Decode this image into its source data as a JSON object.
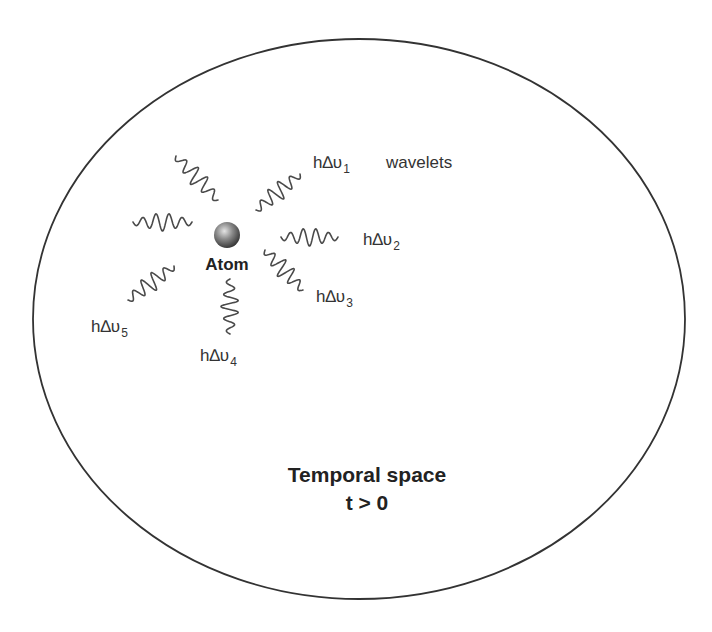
{
  "diagram": {
    "boundary": {
      "shape": "ellipse",
      "cx": 359,
      "cy": 319,
      "rx": 326,
      "ry": 280,
      "stroke": "#333333"
    },
    "atom": {
      "label": "Atom",
      "cx": 227,
      "cy": 235,
      "r": 13,
      "color_light": "#d8d8d8",
      "color_dark": "#3a3a3a"
    },
    "wavelets_label": "wavelets",
    "emissions": [
      {
        "id": "1",
        "prefix": "h∆υ",
        "subscript": "1",
        "label_x": 313,
        "label_y": 168
      },
      {
        "id": "2",
        "prefix": "h∆υ",
        "subscript": "2",
        "label_x": 363,
        "label_y": 245
      },
      {
        "id": "3",
        "prefix": "h∆υ",
        "subscript": "3",
        "label_x": 316,
        "label_y": 302
      },
      {
        "id": "4",
        "prefix": "h∆υ",
        "subscript": "4",
        "label_x": 200,
        "label_y": 361
      },
      {
        "id": "5",
        "prefix": "h∆υ",
        "subscript": "5",
        "label_x": 91,
        "label_y": 332
      }
    ],
    "wave_packets": [
      {
        "id": "upper-left",
        "x1": 176,
        "y1": 156,
        "x2": 218,
        "y2": 200
      },
      {
        "id": "left",
        "x1": 133,
        "y1": 222,
        "x2": 192,
        "y2": 222
      },
      {
        "id": "upper-right",
        "x1": 256,
        "y1": 210,
        "x2": 300,
        "y2": 174
      },
      {
        "id": "right",
        "x1": 281,
        "y1": 237,
        "x2": 338,
        "y2": 237
      },
      {
        "id": "lower-right",
        "x1": 265,
        "y1": 250,
        "x2": 303,
        "y2": 290
      },
      {
        "id": "lower-left",
        "x1": 128,
        "y1": 300,
        "x2": 174,
        "y2": 266
      },
      {
        "id": "down",
        "x1": 230,
        "y1": 279,
        "x2": 230,
        "y2": 334
      }
    ],
    "region_title": "Temporal space",
    "region_condition": "t > 0"
  }
}
